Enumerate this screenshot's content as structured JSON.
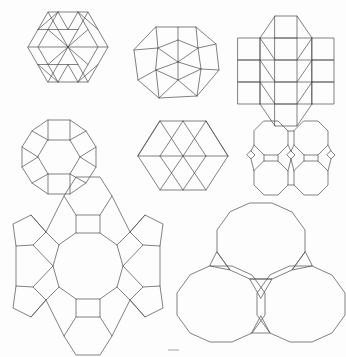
{
  "document": {
    "title": "Plane tilings — vertex-figure patch gallery",
    "background_color": "#fdfdfd",
    "stroke_color": "#4a4a52",
    "stroke_width": 0.7,
    "canvas": {
      "width": 346,
      "height": 357
    },
    "caption_text": ""
  },
  "figures": [
    {
      "id": "figure-1",
      "name": "hexagon-triangle-patch",
      "label": "3.3.3.3.6 hexagon patch",
      "row": 1,
      "column": 1,
      "bbox": {
        "x": 18,
        "y": 12,
        "width": 100,
        "height": 96
      },
      "polygons": [
        {
          "kind": "hexagon-outline",
          "points": "48,12 88,12 108,47 88,82 48,82 28,47"
        },
        {
          "kind": "hexagon-inner",
          "points": "58,22 78,22 88,39 78,56 58,56 48,39"
        },
        {
          "kind": "hexagon-inner",
          "points": "58,62 78,62 88,79 78,96 58,96 48,79"
        },
        {
          "kind": "hexagon-inner",
          "points": "38,42 58,42 68,59 58,76 38,76 28,59"
        },
        {
          "kind": "hexagon-inner",
          "points": "78,42 98,42 108,59 98,76 78,76 68,59"
        }
      ],
      "segments": [
        "28,47 48,12",
        "48,12 88,12",
        "88,12 108,47",
        "108,47 88,82",
        "88,82 48,82",
        "48,82 28,47",
        "28,47 68,47",
        "68,47 108,47",
        "48,12 68,47",
        "88,12 68,47",
        "48,82 68,47",
        "88,82 68,47",
        "38,30 78,30",
        "38,64 78,64",
        "58,12 38,47",
        "78,12 98,47",
        "58,82 38,47",
        "78,82 98,47",
        "48,29 58,12",
        "88,12 98,29",
        "48,65 58,82",
        "88,82 98,65"
      ]
    },
    {
      "id": "figure-2",
      "name": "decagon-fan-patch",
      "label": "Decagonal fan of triangles and squares",
      "row": 1,
      "column": 2,
      "bbox": {
        "x": 133,
        "y": 25,
        "width": 90,
        "height": 75
      },
      "center": {
        "x": 178,
        "y": 62
      },
      "outer_points": "154,27 196,27 216,44 219,70 196,96 158,98 138,80 134,50",
      "inner_points": "158,48 178,40 198,48 200,68 178,80 156,70"
    },
    {
      "id": "figure-3",
      "name": "square-triangle-grid-patch",
      "label": "3.3.4.3.4 square and triangle grid",
      "row": 1,
      "column": 3,
      "bbox": {
        "x": 236,
        "y": 16,
        "width": 100,
        "height": 90
      },
      "columns": 5,
      "rows": 4
    },
    {
      "id": "figure-4",
      "name": "dodecagon-rosette-patch",
      "label": "Dodecagon of squares, triangles and a hexagon",
      "row": 2,
      "column": 1,
      "bbox": {
        "x": 20,
        "y": 120,
        "width": 78,
        "height": 74
      },
      "center": {
        "x": 59,
        "y": 157
      },
      "outer_radius": 38,
      "inner_radius": 20
    },
    {
      "id": "figure-5",
      "name": "hexagon-triangle-band-patch",
      "label": "Elongated hexagon with triangle band",
      "row": 2,
      "column": 2,
      "bbox": {
        "x": 136,
        "y": 120,
        "width": 94,
        "height": 72
      },
      "outer_points": "160,121 206,121 228,156 206,190 160,190 138,156"
    },
    {
      "id": "figure-6",
      "name": "octagon-square-quad-patch",
      "label": "4.8.8 four octagons with squares",
      "row": 2,
      "column": 3,
      "bbox": {
        "x": 248,
        "y": 120,
        "width": 86,
        "height": 72
      },
      "octagon_centers": [
        {
          "x": 271,
          "y": 141
        },
        {
          "x": 311,
          "y": 141
        },
        {
          "x": 271,
          "y": 175
        },
        {
          "x": 311,
          "y": 175
        }
      ],
      "square_centers": [
        {
          "x": 291,
          "y": 158
        },
        {
          "x": 251,
          "y": 158
        },
        {
          "x": 331,
          "y": 158
        }
      ]
    },
    {
      "id": "figure-7",
      "name": "hexagon-square-ring-patch",
      "label": "Ring of hexagons and squares around a dodecagon",
      "row": 3,
      "column": 1,
      "bbox": {
        "x": 14,
        "y": 202,
        "width": 148,
        "height": 146
      },
      "center": {
        "x": 88,
        "y": 275
      },
      "ring_radius": 45,
      "outer_radius": 72,
      "satellite_count": 12
    },
    {
      "id": "figure-8",
      "name": "three-dodecagon-patch",
      "label": "Three dodecagons with interstitial triangles",
      "row": 3,
      "column": 2,
      "bbox": {
        "x": 186,
        "y": 202,
        "width": 150,
        "height": 146
      },
      "dodecagon_centers": [
        {
          "x": 261,
          "y": 245
        },
        {
          "x": 221,
          "y": 308
        },
        {
          "x": 301,
          "y": 308
        }
      ],
      "dodecagon_radius": 43,
      "triangle_count": 3
    }
  ]
}
